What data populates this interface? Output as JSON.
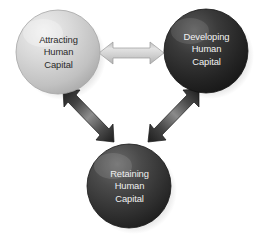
{
  "diagram": {
    "type": "cycle-diagram",
    "background_color": "#ffffff",
    "nodes": [
      {
        "id": "attracting",
        "lines": [
          "Attracting",
          "Human",
          "Capital"
        ],
        "shape": "sphere",
        "fill_color": "#c9c9c9",
        "text_color": "#2a2a2a",
        "center": {
          "x": 58,
          "y": 52
        },
        "radius": 42
      },
      {
        "id": "developing",
        "lines": [
          "Developing",
          "Human",
          "Capital"
        ],
        "shape": "sphere",
        "fill_color": "#2b2b2b",
        "text_color": "#f2f2f2",
        "center": {
          "x": 206,
          "y": 51
        },
        "radius": 42
      },
      {
        "id": "retaining",
        "lines": [
          "Retaining",
          "Human",
          "Capital"
        ],
        "shape": "sphere",
        "fill_color": "#3a3a3a",
        "text_color": "#f0f0f0",
        "center": {
          "x": 129,
          "y": 186
        },
        "radius": 42
      }
    ],
    "connectors": [
      {
        "id": "attracting-developing",
        "from": "attracting",
        "to": "developing",
        "style": "double-headed-arrow",
        "orientation": "horizontal",
        "color": "#d2d2d2"
      },
      {
        "id": "attracting-retaining",
        "from": "attracting",
        "to": "retaining",
        "style": "double-headed-arrow",
        "orientation": "diagonal-down-right",
        "color": "#3d3d3d"
      },
      {
        "id": "developing-retaining",
        "from": "developing",
        "to": "retaining",
        "style": "double-headed-arrow",
        "orientation": "diagonal-down-left",
        "color": "#3d3d3d"
      }
    ]
  }
}
